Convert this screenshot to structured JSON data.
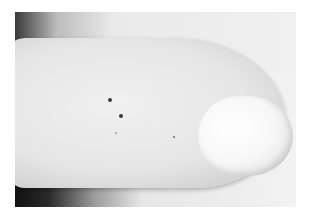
{
  "image": {
    "description": "Grayscale close-up photograph of a fingertip with fingernail, showing a few small dark spots on the skin",
    "colors": {
      "background": "#ffffff",
      "skin": "#e6e6e6",
      "nail": "#f7f7f7",
      "shadow": "#111111",
      "spot": "#3a3a3a"
    }
  }
}
